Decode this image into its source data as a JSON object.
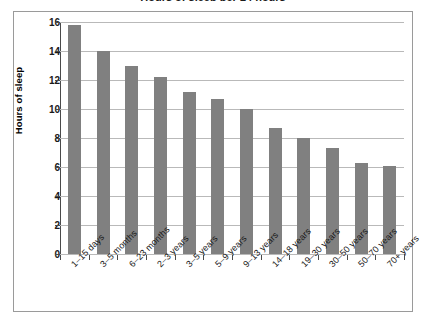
{
  "chart_data": {
    "type": "bar",
    "title": "Hours of sleep per 24 hours",
    "xlabel": "",
    "ylabel": "Hours of sleep",
    "ylim": [
      0,
      16
    ],
    "ytick_interval": 2,
    "yticks": [
      "16",
      "14",
      "12",
      "10",
      "8",
      "6",
      "4",
      "2",
      "0"
    ],
    "grid": true,
    "legend": "none",
    "bar_color": "#808080",
    "gridline_color": "#b9b9b9",
    "axis_color": "#4a4a4a",
    "background_color": "#ffffff",
    "categories": [
      "1–15 days",
      "3–5 months",
      "6–23 months",
      "2–3 years",
      "3–5 years",
      "5–9 years",
      "9–13 years",
      "14–18 years",
      "19–30 years",
      "30–50 years",
      "50–70 years",
      "70+ years"
    ],
    "values": [
      15.8,
      14.0,
      13.0,
      12.2,
      11.2,
      10.7,
      10.0,
      8.7,
      8.0,
      7.3,
      6.3,
      6.1
    ]
  }
}
